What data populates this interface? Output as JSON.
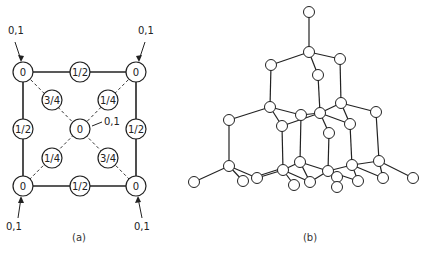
{
  "figure_a": {
    "caption": "(a)",
    "corner_annotations": [
      "0,1",
      "0,1",
      "0,1",
      "0,1"
    ],
    "center_annotation": "0,1",
    "nodes": [
      {
        "id": "tl",
        "x": 23,
        "y": 72,
        "label": "0"
      },
      {
        "id": "tm",
        "x": 80,
        "y": 72,
        "label": "1/2"
      },
      {
        "id": "tr",
        "x": 136,
        "y": 72,
        "label": "0"
      },
      {
        "id": "ml",
        "x": 23,
        "y": 129,
        "label": "1/2"
      },
      {
        "id": "c",
        "x": 80,
        "y": 129,
        "label": "0"
      },
      {
        "id": "mr",
        "x": 136,
        "y": 129,
        "label": "1/2"
      },
      {
        "id": "bl",
        "x": 23,
        "y": 186,
        "label": "0"
      },
      {
        "id": "bm",
        "x": 80,
        "y": 186,
        "label": "1/2"
      },
      {
        "id": "br",
        "x": 136,
        "y": 186,
        "label": "0"
      },
      {
        "id": "d1",
        "x": 52,
        "y": 100,
        "label": "3/4"
      },
      {
        "id": "d2",
        "x": 108,
        "y": 100,
        "label": "1/4"
      },
      {
        "id": "d3",
        "x": 52,
        "y": 158,
        "label": "1/4"
      },
      {
        "id": "d4",
        "x": 108,
        "y": 158,
        "label": "3/4"
      }
    ]
  },
  "figure_b": {
    "caption": "(b)"
  }
}
